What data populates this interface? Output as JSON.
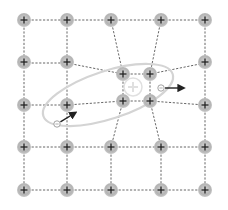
{
  "diagram": {
    "ion_symbol": "+",
    "electron_symbol": "−",
    "colors": {
      "ion_fill": "#b8b8b8",
      "ion_center": "#d8d8d8",
      "bond_line": "#555555",
      "ellipse": "#d4d4d4",
      "arrow": "#222222",
      "center_charge": "#e0e0e0"
    },
    "lattice": {
      "columns_x": [
        24,
        67,
        111,
        161,
        205
      ],
      "rows_y": [
        20,
        63,
        105,
        147,
        190
      ]
    },
    "ions": [
      {
        "x": 24,
        "y": 20
      },
      {
        "x": 67,
        "y": 20
      },
      {
        "x": 111,
        "y": 20
      },
      {
        "x": 161,
        "y": 20
      },
      {
        "x": 205,
        "y": 20
      },
      {
        "x": 24,
        "y": 62
      },
      {
        "x": 67,
        "y": 62
      },
      {
        "x": 205,
        "y": 62
      },
      {
        "x": 24,
        "y": 105
      },
      {
        "x": 67,
        "y": 105
      },
      {
        "x": 205,
        "y": 105
      },
      {
        "x": 24,
        "y": 147
      },
      {
        "x": 67,
        "y": 147
      },
      {
        "x": 111,
        "y": 147
      },
      {
        "x": 161,
        "y": 147
      },
      {
        "x": 205,
        "y": 147
      },
      {
        "x": 24,
        "y": 190
      },
      {
        "x": 67,
        "y": 190
      },
      {
        "x": 111,
        "y": 190
      },
      {
        "x": 161,
        "y": 190
      },
      {
        "x": 205,
        "y": 190
      },
      {
        "x": 123,
        "y": 74
      },
      {
        "x": 150,
        "y": 74
      },
      {
        "x": 123,
        "y": 101
      },
      {
        "x": 150,
        "y": 101
      }
    ],
    "displaced_ions": [
      {
        "x": 123,
        "y": 74
      },
      {
        "x": 150,
        "y": 74
      },
      {
        "x": 123,
        "y": 101
      },
      {
        "x": 150,
        "y": 101
      }
    ],
    "positive_region": {
      "x": 133,
      "y": 87,
      "label": "+"
    },
    "electrons": [
      {
        "x": 161,
        "y": 88,
        "arrow_to": {
          "x": 183,
          "y": 88
        }
      },
      {
        "x": 57,
        "y": 124,
        "arrow_to": {
          "x": 75,
          "y": 113
        }
      }
    ],
    "ellipse": {
      "cx": 108,
      "cy": 95,
      "rx": 68,
      "ry": 24,
      "rotate": -18
    }
  }
}
